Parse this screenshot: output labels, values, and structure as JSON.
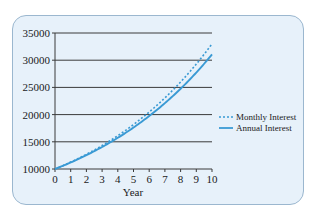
{
  "chart_data": {
    "type": "line",
    "title": "",
    "xlabel": "Year",
    "ylabel": "",
    "xlim": [
      0,
      10
    ],
    "ylim": [
      10000,
      35000
    ],
    "x_ticks": [
      0,
      1,
      2,
      3,
      4,
      5,
      6,
      7,
      8,
      9,
      10
    ],
    "y_ticks": [
      10000,
      15000,
      20000,
      25000,
      30000,
      35000
    ],
    "grid": "horizontal",
    "legend_position": "right",
    "x": [
      0,
      1,
      2,
      3,
      4,
      5,
      6,
      7,
      8,
      9,
      10
    ],
    "series": [
      {
        "name": "Monthly Interest",
        "style": "dotted",
        "color": "#3a9ad4",
        "values": [
          10000,
          11268,
          12697,
          14308,
          16122,
          18167,
          20471,
          23067,
          25993,
          29289,
          33004
        ]
      },
      {
        "name": "Annual Interest",
        "style": "solid",
        "color": "#3a9ad4",
        "values": [
          10000,
          11200,
          12544,
          14049,
          15735,
          17623,
          19738,
          22107,
          24760,
          27731,
          31058
        ]
      }
    ]
  },
  "axis": {
    "x_title": "Year",
    "x_tick_labels": [
      "0",
      "1",
      "2",
      "3",
      "4",
      "5",
      "6",
      "7",
      "8",
      "9",
      "10"
    ],
    "y_tick_labels": [
      "35000",
      "30000",
      "25000",
      "20000",
      "15000",
      "10000"
    ]
  },
  "legend": {
    "items": [
      {
        "label": "Monthly Interest"
      },
      {
        "label": "Annual Interest"
      }
    ]
  },
  "colors": {
    "curve": "#3a9ad4",
    "grid": "#3a3a3a",
    "panel_bg": "#e7f1fa"
  }
}
